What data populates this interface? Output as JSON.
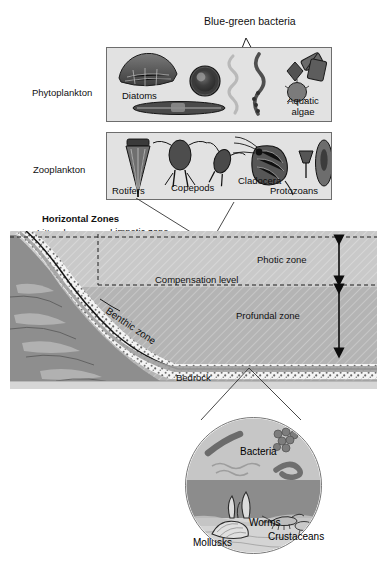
{
  "diagram": {
    "background": "#ffffff"
  },
  "top_annotation": {
    "label": "Blue-green bacteria",
    "pointer": "v-shaped-leader-line"
  },
  "categories": [
    {
      "id": "phytoplankton",
      "label": "Phytoplankton"
    },
    {
      "id": "zooplankton",
      "label": "Zooplankton"
    }
  ],
  "phytoplankton_box": {
    "organisms": [
      {
        "id": "diatoms",
        "label": "Diatoms"
      },
      {
        "id": "aquatic-algae",
        "label": "Aquatic",
        "label2": "algae"
      }
    ]
  },
  "zooplankton_box": {
    "organisms": [
      {
        "id": "rotifers",
        "label": "Rotifers"
      },
      {
        "id": "copepods",
        "label": "Copepods"
      },
      {
        "id": "cladocera",
        "label": "Cladocera"
      },
      {
        "id": "protozoans",
        "label": "Protozoans"
      }
    ]
  },
  "lake": {
    "horizontal_zones_title": "Horizontal Zones",
    "vertical_zones_title": "Vertical Zones",
    "zones": {
      "littoral": "Littoral zone",
      "limnetic": "Limnetic zone",
      "photic": "Photic zone",
      "compensation": "Compensation level",
      "profundal": "Profundal zone",
      "benthic": "Benthic zone",
      "bedrock": "Bedrock"
    },
    "colors": {
      "photic_water": "#c9c9c9",
      "profundal_water": "#b4b4b4",
      "bedrock_rock": "#8e8e8e",
      "sediment": "#f1f1f1",
      "shore_band": "#a8a8a8",
      "outline": "#1a1a1a"
    }
  },
  "benthic_inset": {
    "organisms": [
      {
        "id": "bacteria",
        "label": "Bacteria"
      },
      {
        "id": "worms",
        "label": "Worms"
      },
      {
        "id": "mollusks",
        "label": "Mollusks"
      },
      {
        "id": "crustaceans",
        "label": "Crustaceans"
      }
    ],
    "colors": {
      "water": "#c6c6c6",
      "mud": "#8c8c8c",
      "sediment": "#d8d8d8"
    }
  }
}
